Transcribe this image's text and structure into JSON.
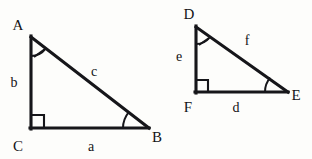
{
  "figure": {
    "background_color": "#fdfdfb",
    "stroke_color": "#16161a",
    "caption": "",
    "triangles": [
      {
        "id": "triangle-abc",
        "name": "left-triangle",
        "vertices": [
          {
            "label": "A",
            "x": 31,
            "y": 37,
            "label_x": 18,
            "label_y": 30,
            "angle_mark": "arc-with-tick"
          },
          {
            "label": "C",
            "x": 31,
            "y": 128,
            "label_x": 18,
            "label_y": 151,
            "angle_mark": "right-angle-square"
          },
          {
            "label": "B",
            "x": 148,
            "y": 128,
            "label_x": 155,
            "label_y": 142,
            "angle_mark": "arc"
          }
        ],
        "sides": [
          {
            "label": "b",
            "from": "A",
            "to": "C",
            "label_x": 12,
            "label_y": 87
          },
          {
            "label": "c",
            "from": "A",
            "to": "B",
            "label_x": 92,
            "label_y": 76
          },
          {
            "label": "a",
            "from": "C",
            "to": "B",
            "label_x": 89,
            "label_y": 151
          }
        ]
      },
      {
        "id": "triangle-def",
        "name": "right-triangle",
        "vertices": [
          {
            "label": "D",
            "x": 196,
            "y": 27,
            "label_x": 186,
            "label_y": 19,
            "angle_mark": "arc-with-tick"
          },
          {
            "label": "F",
            "x": 196,
            "y": 92,
            "label_x": 185,
            "label_y": 112,
            "angle_mark": "right-angle-square"
          },
          {
            "label": "E",
            "x": 287,
            "y": 92,
            "label_x": 292,
            "label_y": 100,
            "angle_mark": "arc"
          }
        ],
        "sides": [
          {
            "label": "e",
            "from": "D",
            "to": "F",
            "label_x": 177,
            "label_y": 61
          },
          {
            "label": "f",
            "from": "D",
            "to": "E",
            "label_x": 245,
            "label_y": 45
          },
          {
            "label": "d",
            "from": "F",
            "to": "E",
            "label_x": 234,
            "label_y": 112
          }
        ]
      }
    ]
  }
}
